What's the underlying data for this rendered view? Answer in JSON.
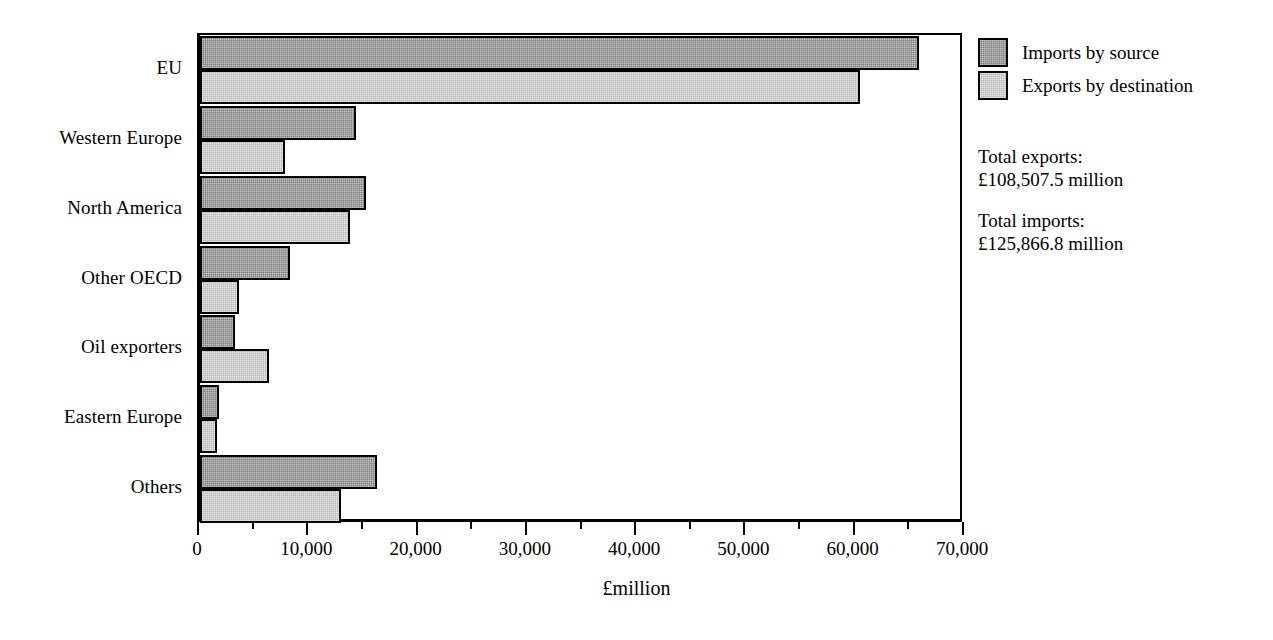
{
  "chart_data": {
    "type": "bar",
    "orientation": "horizontal",
    "title": "",
    "xlabel": "£million",
    "ylabel": "",
    "xlim": [
      0,
      70000
    ],
    "xticks": [
      0,
      10000,
      20000,
      30000,
      40000,
      50000,
      60000,
      70000
    ],
    "xtick_labels": [
      "0",
      "10,000",
      "20,000",
      "30,000",
      "40,000",
      "50,000",
      "60,000",
      "70,000"
    ],
    "minor_tick_interval": 5000,
    "grid": false,
    "legend_position": "right",
    "categories": [
      "EU",
      "Western Europe",
      "North America",
      "Other OECD",
      "Oil exporters",
      "Eastern Europe",
      "Others"
    ],
    "series": [
      {
        "name": "Imports by source",
        "color": "#7d7d7d",
        "values": [
          65800,
          14300,
          15200,
          8200,
          3200,
          1700,
          16200
        ]
      },
      {
        "name": "Exports by destination",
        "color": "#b6b6b6",
        "values": [
          60400,
          7800,
          13700,
          3600,
          6300,
          1600,
          12900
        ]
      }
    ],
    "annotations": [
      {
        "label": "Total exports:",
        "value": "£108,507.5 million"
      },
      {
        "label": "Total imports:",
        "value": "£125,866.8 million"
      }
    ]
  },
  "legend": {
    "items": [
      {
        "label": "Imports by source",
        "swatch": "imports"
      },
      {
        "label": "Exports by destination",
        "swatch": "exports"
      }
    ]
  },
  "totals": {
    "exports_label": "Total exports:",
    "exports_value": "£108,507.5 million",
    "imports_label": "Total imports:",
    "imports_value": "£125,866.8 million"
  },
  "axis": {
    "x_title": "£million"
  }
}
